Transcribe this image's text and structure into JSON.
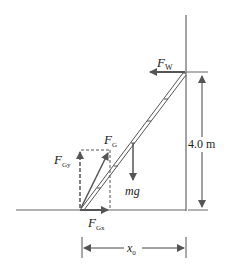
{
  "diagram": {
    "type": "free-body diagram of ladder against wall",
    "labels": {
      "wall_force": {
        "main": "F",
        "sub": "W"
      },
      "ground_force": {
        "main": "F",
        "sub": "G"
      },
      "ground_force_y": {
        "main": "F",
        "sub": "Gy"
      },
      "ground_force_x": {
        "main": "F",
        "sub": "Gx"
      },
      "weight": "mg",
      "height": "4.0 m",
      "base_distance": {
        "main": "x",
        "sub": "0"
      }
    },
    "colors": {
      "line": "#555555",
      "arrow": "#555555",
      "text": "#222222",
      "background": "#ffffff"
    }
  }
}
